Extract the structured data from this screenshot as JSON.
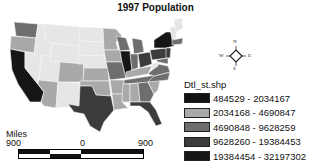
{
  "title": "1997 Population",
  "legend": {
    "title": "Dtl_st.shp",
    "classes": [
      {
        "label": "484529 - 2034167",
        "color": "#111111"
      },
      {
        "label": "2034168 - 4690847",
        "color": "#a9a9a9"
      },
      {
        "label": "4690848 - 9628259",
        "color": "#6e6e6e"
      },
      {
        "label": "9628260 - 19384453",
        "color": "#3c3c3c"
      },
      {
        "label": "19384454 - 32197302",
        "color": "#161616"
      }
    ]
  },
  "compass": {
    "n": "N",
    "s": "S",
    "e": "E",
    "w": "W"
  },
  "scale_bar": {
    "unit_label": "Miles",
    "ticks": [
      "900",
      "0",
      "900"
    ]
  },
  "map": {
    "class_colors": {
      "c1": "#e6e6e6",
      "c2": "#a9a9a9",
      "c3": "#6e6e6e",
      "c4": "#3c3c3c",
      "c5": "#161616"
    }
  }
}
